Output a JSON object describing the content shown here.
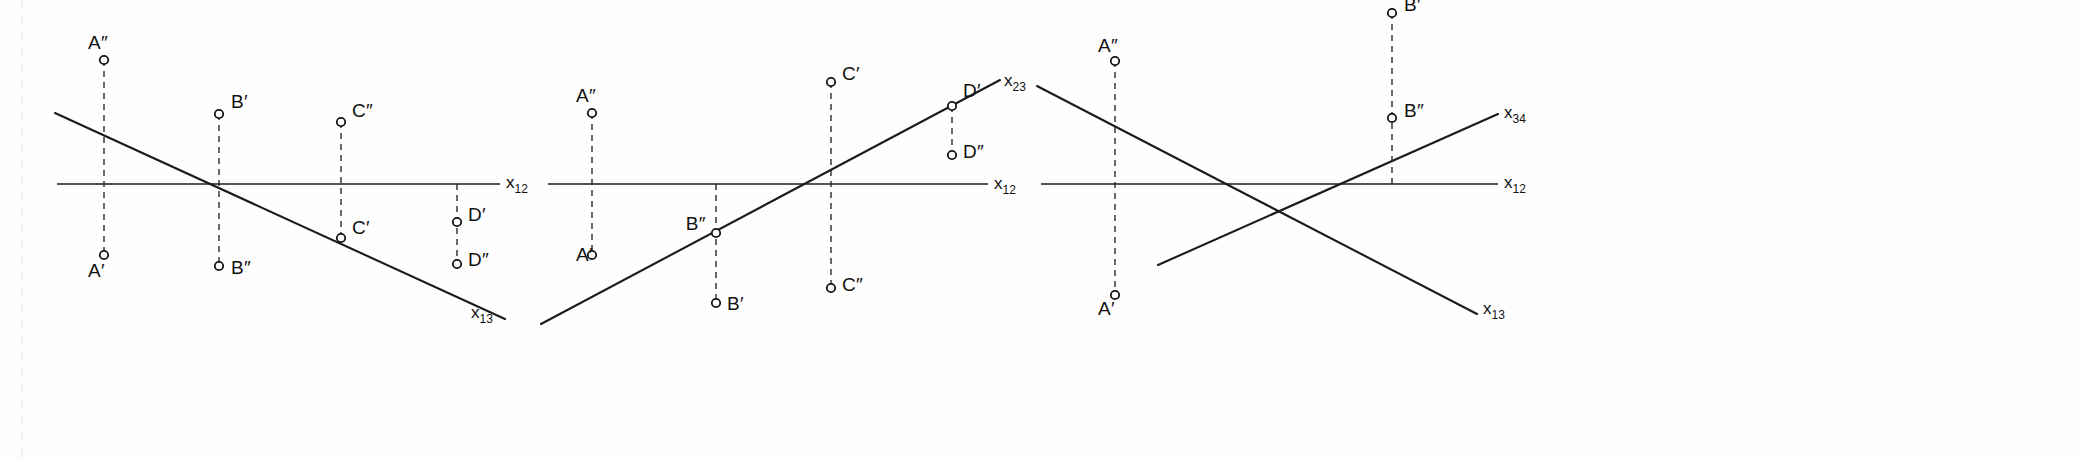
{
  "figure": {
    "background_color": "#fefefe",
    "line_color": "#1b1b1b",
    "marker_fill": "#ffffff",
    "width": 2080,
    "height": 460
  },
  "panels": [
    {
      "id": "panel-1",
      "ground_axis": {
        "label_base": "x",
        "label_sub": "12"
      },
      "trace_axis": {
        "label_base": "x",
        "label_sub": "13"
      },
      "points": [
        {
          "key": "A2",
          "label_base": "A",
          "label_prime": "″",
          "x": 104,
          "y": 60,
          "label_x": 88,
          "label_y": 49,
          "anchor": "start"
        },
        {
          "key": "A1",
          "label_base": "A",
          "label_prime": "′",
          "x": 104,
          "y": 255,
          "label_x": 88,
          "label_y": 277,
          "anchor": "start"
        },
        {
          "key": "B1",
          "label_base": "B",
          "label_prime": "′",
          "x": 219,
          "y": 114,
          "label_x": 231,
          "label_y": 108,
          "anchor": "start"
        },
        {
          "key": "B2",
          "label_base": "B",
          "label_prime": "″",
          "x": 219,
          "y": 266,
          "label_x": 231,
          "label_y": 274,
          "anchor": "start"
        },
        {
          "key": "C2",
          "label_base": "C",
          "label_prime": "″",
          "x": 341,
          "y": 122,
          "label_x": 352,
          "label_y": 117,
          "anchor": "start"
        },
        {
          "key": "C1",
          "label_base": "C",
          "label_prime": "′",
          "x": 341,
          "y": 238,
          "label_x": 352,
          "label_y": 234,
          "anchor": "start"
        },
        {
          "key": "D1",
          "label_base": "D",
          "label_prime": "′",
          "x": 457,
          "y": 222,
          "label_x": 468,
          "label_y": 221,
          "anchor": "start"
        },
        {
          "key": "D2",
          "label_base": "D",
          "label_prime": "″",
          "x": 457,
          "y": 264,
          "label_x": 468,
          "label_y": 266,
          "anchor": "start"
        }
      ]
    },
    {
      "id": "panel-2",
      "ground_axis": {
        "label_base": "x",
        "label_sub": "12"
      },
      "trace_axis": {
        "label_base": "x",
        "label_sub": "23"
      },
      "points": [
        {
          "key": "A2",
          "label_base": "A",
          "label_prime": "″",
          "x": 592,
          "y": 113,
          "label_x": 576,
          "label_y": 102,
          "anchor": "start"
        },
        {
          "key": "A1",
          "label_base": "A",
          "label_prime": "′",
          "x": 592,
          "y": 255,
          "label_x": 576,
          "label_y": 261,
          "anchor": "start"
        },
        {
          "key": "B2",
          "label_base": "B",
          "label_prime": "″",
          "x": 716,
          "y": 233,
          "label_x": 694,
          "label_y": 230,
          "anchor": "end"
        },
        {
          "key": "B1",
          "label_base": "B",
          "label_prime": "′",
          "x": 716,
          "y": 303,
          "label_x": 727,
          "label_y": 310,
          "anchor": "start"
        },
        {
          "key": "C1",
          "label_base": "C",
          "label_prime": "′",
          "x": 831,
          "y": 82,
          "label_x": 842,
          "label_y": 80,
          "anchor": "start"
        },
        {
          "key": "C2",
          "label_base": "C",
          "label_prime": "″",
          "x": 831,
          "y": 288,
          "label_x": 842,
          "label_y": 291,
          "anchor": "start"
        },
        {
          "key": "D1",
          "label_base": "D",
          "label_prime": "′",
          "x": 952,
          "y": 106,
          "label_x": 963,
          "label_y": 97,
          "anchor": "start"
        },
        {
          "key": "D2",
          "label_base": "D",
          "label_prime": "″",
          "x": 952,
          "y": 155,
          "label_x": 963,
          "label_y": 158,
          "anchor": "start"
        }
      ]
    },
    {
      "id": "panel-3",
      "ground_axis": {
        "label_base": "x",
        "label_sub": "12"
      },
      "trace_axis_upper": {
        "label_base": "x",
        "label_sub": "34"
      },
      "trace_axis_lower": {
        "label_base": "x",
        "label_sub": "13"
      },
      "points": [
        {
          "key": "A2",
          "label_base": "A",
          "label_prime": "″",
          "x": 1115,
          "y": 61,
          "label_x": 1098,
          "label_y": 52,
          "anchor": "start"
        },
        {
          "key": "A1",
          "label_base": "A",
          "label_prime": "′",
          "x": 1115,
          "y": 295,
          "label_x": 1098,
          "label_y": 315,
          "anchor": "start"
        },
        {
          "key": "B1",
          "label_base": "B",
          "label_prime": "′",
          "x": 1392,
          "y": 13,
          "label_x": 1404,
          "label_y": 11,
          "anchor": "start"
        },
        {
          "key": "B2",
          "label_base": "B",
          "label_prime": "″",
          "x": 1392,
          "y": 118,
          "label_x": 1404,
          "label_y": 117,
          "anchor": "start"
        }
      ]
    }
  ],
  "geometry": {
    "panel1": {
      "ground_y": 184,
      "ground_x_start": 57,
      "ground_x_end": 500,
      "ground_label_x": 506,
      "ground_label_y": 188,
      "trace_x1": 55,
      "trace_y1": 113,
      "trace_x2": 505,
      "trace_y2": 319,
      "trace_label_x": 471,
      "trace_label_y": 318
    },
    "panel2": {
      "ground_y": 184,
      "ground_x_start": 548,
      "ground_x_end": 988,
      "ground_label_x": 994,
      "ground_label_y": 189,
      "trace_x1": 541,
      "trace_y1": 324,
      "trace_x2": 1000,
      "trace_y2": 80,
      "trace_label_x": 1004,
      "trace_label_y": 86
    },
    "panel3": {
      "ground_y": 184,
      "ground_x_start": 1041,
      "ground_x_end": 1498,
      "ground_label_x": 1504,
      "ground_label_y": 188,
      "desc_x1": 1037,
      "desc_y1": 86,
      "desc_x2": 1477,
      "desc_y2": 314,
      "desc_label_x": 1483,
      "desc_label_y": 314,
      "asc_x1": 1158,
      "asc_y1": 265,
      "asc_x2": 1498,
      "asc_y2": 114,
      "asc_label_x": 1504,
      "asc_label_y": 118
    }
  }
}
